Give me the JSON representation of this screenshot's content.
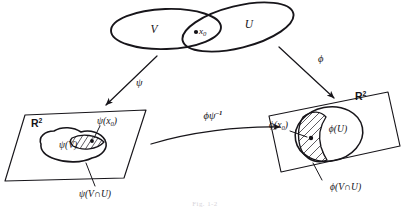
{
  "figure": {
    "kind": "hand-drawn mathematical diagram",
    "caption": "Fig. 1-2",
    "background_color": "#ffffff",
    "ink_color": "#17151a"
  },
  "manifold": {
    "set_v_label": "V",
    "set_u_label": "U",
    "point_label": "x",
    "point_subscript": "0"
  },
  "maps": {
    "psi_label": "ψ",
    "phi_label": "ϕ",
    "transition_label": "ϕψ",
    "transition_exponent": "–1"
  },
  "left_plane": {
    "space_label": "R",
    "space_exponent": "2",
    "image_label": "ψ(V)",
    "point_label": "ψ(x",
    "point_label_sub": "0",
    "point_label_end": ")",
    "intersection_label": "ψ(V∩U)"
  },
  "right_plane": {
    "space_label": "R",
    "space_exponent": "2",
    "image_label": "ϕ(U)",
    "point_label": "ϕ(x",
    "point_label_sub": "0",
    "point_label_end": ")",
    "intersection_label": "ϕ(V∩U)"
  }
}
